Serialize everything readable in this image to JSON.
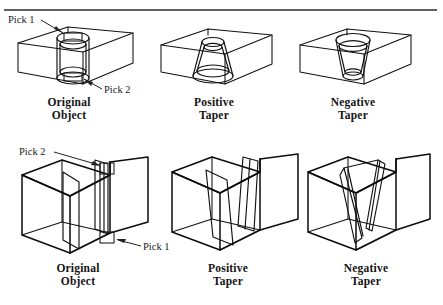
{
  "figure": {
    "title_rule": "horizontal-divider",
    "background_color": "#ffffff",
    "line_color": "#111111",
    "rows": [
      {
        "id": "row-cylinder",
        "description": "Box with cylindrical hole feature",
        "panels": [
          {
            "id": "panel-original-cylinder",
            "caption_line1": "Original",
            "caption_line2": "Object",
            "shape": "box-with-cylinder",
            "callouts": [
              {
                "label": "Pick 1",
                "target": "cylinder-top-face"
              },
              {
                "label": "Pick 2",
                "target": "cylinder-bottom-face"
              }
            ]
          },
          {
            "id": "panel-positive-taper-cylinder",
            "caption_line1": "Positive",
            "caption_line2": "Taper",
            "shape": "box-with-frustum-wide-bottom",
            "callouts": []
          },
          {
            "id": "panel-negative-taper-cylinder",
            "caption_line1": "Negative",
            "caption_line2": "Taper",
            "shape": "box-with-frustum-narrow-bottom",
            "callouts": []
          }
        ]
      },
      {
        "id": "row-slot",
        "description": "Notched block with vertical slot feature",
        "panels": [
          {
            "id": "panel-original-slot",
            "caption_line1": "Original",
            "caption_line2": "Object",
            "shape": "notched-block-with-straight-slot",
            "callouts": [
              {
                "label": "Pick 2",
                "target": "slot-top-edge"
              },
              {
                "label": "Pick 1",
                "target": "slot-bottom-edge"
              }
            ]
          },
          {
            "id": "panel-positive-taper-slot",
            "caption_line1": "Positive",
            "caption_line2": "Taper",
            "shape": "notched-block-with-tapered-slot-positive",
            "callouts": []
          },
          {
            "id": "panel-negative-taper-slot",
            "caption_line1": "Negative",
            "caption_line2": "Taper",
            "shape": "notched-block-with-tapered-slot-negative",
            "callouts": []
          }
        ]
      }
    ]
  }
}
